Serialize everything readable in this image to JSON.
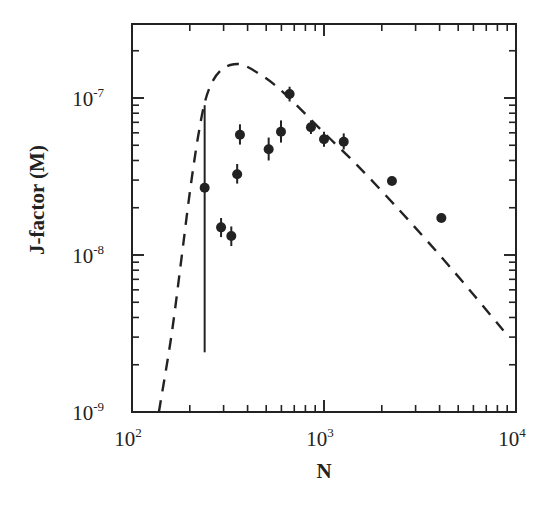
{
  "chart_data": {
    "type": "scatter",
    "title": "",
    "xlabel": "N",
    "ylabel": "J-factor (M)",
    "xscale": "log",
    "yscale": "log",
    "xlim": [
      100,
      10000
    ],
    "ylim": [
      1e-09,
      3e-07
    ],
    "grid": false,
    "legend": null,
    "x_ticks": [
      {
        "base": "10",
        "exp": "2",
        "value": 100
      },
      {
        "base": "10",
        "exp": "3",
        "value": 1000
      },
      {
        "base": "10",
        "exp": "4",
        "value": 10000
      }
    ],
    "y_ticks": [
      {
        "base": "10",
        "exp": "-9",
        "value": 1e-09
      },
      {
        "base": "10",
        "exp": "-8",
        "value": 1e-08
      },
      {
        "base": "10",
        "exp": "-7",
        "value": 1e-07
      }
    ],
    "series": [
      {
        "name": "measured",
        "style": "filled-circle-with-error-bars",
        "points": [
          {
            "x": 239,
            "y": 2.68e-08,
            "ylo": 2.4e-09,
            "yhi": 9e-08
          },
          {
            "x": 291,
            "y": 1.5e-08,
            "ylo": 1.3e-08,
            "yhi": 1.72e-08
          },
          {
            "x": 329,
            "y": 1.32e-08,
            "ylo": 1.14e-08,
            "yhi": 1.52e-08
          },
          {
            "x": 353,
            "y": 3.27e-08,
            "ylo": 2.85e-08,
            "yhi": 3.8e-08
          },
          {
            "x": 365,
            "y": 5.84e-08,
            "ylo": 5.05e-08,
            "yhi": 6.8e-08
          },
          {
            "x": 515,
            "y": 4.71e-08,
            "ylo": 4e-08,
            "yhi": 5.6e-08
          },
          {
            "x": 597,
            "y": 6.1e-08,
            "ylo": 5.2e-08,
            "yhi": 7.2e-08
          },
          {
            "x": 662,
            "y": 1.06e-07,
            "ylo": 9.5e-08,
            "yhi": 1.18e-07
          },
          {
            "x": 855,
            "y": 6.51e-08,
            "ylo": 5.9e-08,
            "yhi": 7.2e-08
          },
          {
            "x": 1000,
            "y": 5.46e-08,
            "ylo": 4.9e-08,
            "yhi": 6.1e-08
          },
          {
            "x": 1267,
            "y": 5.27e-08,
            "ylo": 4.7e-08,
            "yhi": 5.95e-08
          },
          {
            "x": 2259,
            "y": 2.96e-08
          },
          {
            "x": 4085,
            "y": 1.72e-08
          }
        ]
      },
      {
        "name": "model",
        "style": "dashed-line",
        "points": [
          {
            "x": 138,
            "y": 1e-09
          },
          {
            "x": 160,
            "y": 3e-09
          },
          {
            "x": 180,
            "y": 9e-09
          },
          {
            "x": 200,
            "y": 2.5e-08
          },
          {
            "x": 220,
            "y": 5.5e-08
          },
          {
            "x": 240,
            "y": 9.5e-08
          },
          {
            "x": 265,
            "y": 1.3e-07
          },
          {
            "x": 300,
            "y": 1.55e-07
          },
          {
            "x": 340,
            "y": 1.64e-07
          },
          {
            "x": 380,
            "y": 1.62e-07
          },
          {
            "x": 450,
            "y": 1.45e-07
          },
          {
            "x": 550,
            "y": 1.22e-07
          },
          {
            "x": 700,
            "y": 9.3e-08
          },
          {
            "x": 1000,
            "y": 6e-08
          },
          {
            "x": 1500,
            "y": 3.7e-08
          },
          {
            "x": 2500,
            "y": 1.9e-08
          },
          {
            "x": 4000,
            "y": 1e-08
          },
          {
            "x": 6000,
            "y": 5.6e-09
          },
          {
            "x": 8600,
            "y": 3.3e-09
          }
        ]
      }
    ]
  }
}
